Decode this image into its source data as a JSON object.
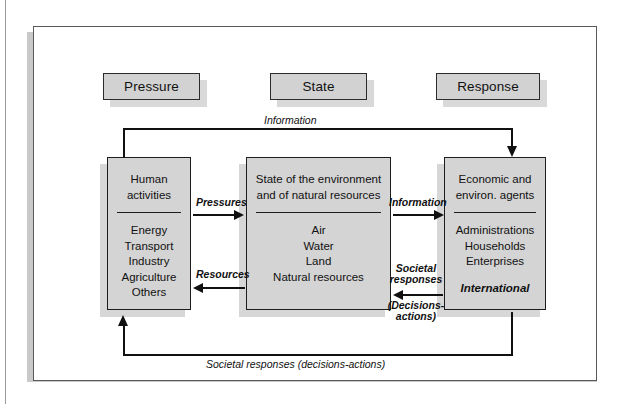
{
  "diagram": {
    "title_row": [
      {
        "label": "Pressure"
      },
      {
        "label": "State"
      },
      {
        "label": "Response"
      }
    ],
    "boxes": [
      {
        "id": "human-activities",
        "head": [
          "Human",
          "activities"
        ],
        "body": [
          "Energy",
          "Transport",
          "Industry",
          "Agriculture",
          "Others"
        ],
        "emphasis": ""
      },
      {
        "id": "state-environment",
        "head": [
          "State of the environment",
          "and of natural resources"
        ],
        "body": [
          "Air",
          "Water",
          "Land",
          "Natural resources"
        ],
        "emphasis": ""
      },
      {
        "id": "economic-agents",
        "head": [
          "Economic and",
          "environ. agents"
        ],
        "body": [
          "Administrations",
          "Households",
          "Enterprises"
        ],
        "emphasis": "International"
      }
    ],
    "arrow_labels": {
      "information_top": "Information",
      "pressures": "Pressures",
      "resources": "Resources",
      "information_mid": "Information",
      "societal_line1": "Societal",
      "societal_line2": "responses",
      "societal_line3": "(Decisions-",
      "societal_line4": "actions)",
      "societal_bottom": "Societal responses (decisions-actions)"
    },
    "colors": {
      "box_fill": "#d4d4d4",
      "box_border": "#1d1d1d",
      "chip_fill": "#d2d2d2",
      "frame_border": "#5a5a5a",
      "line": "#111111"
    }
  }
}
